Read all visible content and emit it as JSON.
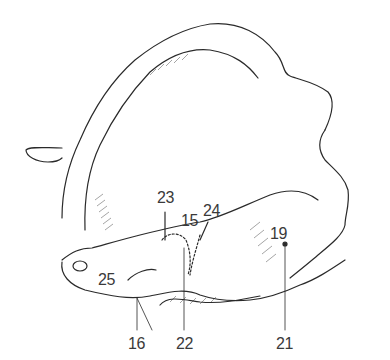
{
  "figure": {
    "labels": [
      {
        "id": "23",
        "text": "23",
        "x": 157,
        "y": 190
      },
      {
        "id": "15",
        "text": "15",
        "x": 181,
        "y": 213
      },
      {
        "id": "24",
        "text": "24",
        "x": 203,
        "y": 203
      },
      {
        "id": "19",
        "text": "19",
        "x": 270,
        "y": 226
      },
      {
        "id": "25",
        "text": "25",
        "x": 98,
        "y": 272
      },
      {
        "id": "16",
        "text": "16",
        "x": 128,
        "y": 336
      },
      {
        "id": "22",
        "text": "22",
        "x": 176,
        "y": 336
      },
      {
        "id": "21",
        "text": "21",
        "x": 276,
        "y": 336
      }
    ],
    "colors": {
      "ink": "#2a2a2a",
      "label": "#3a3a3a",
      "background": "#ffffff"
    }
  }
}
